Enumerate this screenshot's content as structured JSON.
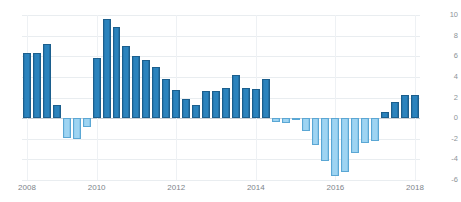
{
  "chart_data": {
    "type": "bar",
    "title": "",
    "subtitle": "",
    "xlabel": "",
    "ylabel": "",
    "ylim": [
      -6,
      10
    ],
    "grid": true,
    "legend": null,
    "y_ticks": [
      10,
      8,
      6,
      4,
      2,
      0,
      -2,
      -4,
      -6
    ],
    "y_tick_labels": [
      "10",
      "8",
      "6",
      "4",
      "2",
      "0",
      "-2",
      "-4",
      "-6"
    ],
    "x_ticks": [
      2008,
      2010,
      2012,
      2014,
      2016,
      2018
    ],
    "x_tick_labels": [
      "2008",
      "2010",
      "2012",
      "2014",
      "2016",
      "2018"
    ],
    "categories": [
      "2008 Q1",
      "2008 Q2",
      "2008 Q3",
      "2008 Q4",
      "2009 Q1",
      "2009 Q2",
      "2009 Q3",
      "2010 Q1",
      "2010 Q2",
      "2010 Q3",
      "2010 Q4",
      "2011 Q1",
      "2011 Q2",
      "2011 Q3",
      "2011 Q4",
      "2012 Q1",
      "2012 Q2",
      "2012 Q3",
      "2012 Q4",
      "2013 Q1",
      "2013 Q2",
      "2013 Q3",
      "2013 Q4",
      "2014 Q1",
      "2014 Q2",
      "2014 Q3",
      "2014 Q4",
      "2015 Q1",
      "2015 Q2",
      "2015 Q3",
      "2015 Q4",
      "2016 Q1",
      "2016 Q2",
      "2016 Q3",
      "2016 Q4",
      "2017 Q1",
      "2017 Q2",
      "2017 Q3",
      "2017 Q4",
      "2018 Q1"
    ],
    "values": [
      6.3,
      6.3,
      7.2,
      1.3,
      -1.9,
      -2.0,
      -0.9,
      5.8,
      9.6,
      8.8,
      7.0,
      6.0,
      5.6,
      5.0,
      3.8,
      2.7,
      1.9,
      1.3,
      2.6,
      2.6,
      2.9,
      4.2,
      2.9,
      2.8,
      3.8,
      -0.4,
      -0.5,
      -0.1,
      -1.2,
      -2.6,
      -4.2,
      -5.6,
      -5.2,
      -3.4,
      -2.4,
      -2.2,
      0.6,
      1.6,
      2.2,
      2.2
    ],
    "colors": {
      "positive_fill": "#2b83bd",
      "positive_border": "#1c5f8d",
      "negative_fill": "#9ed4f2",
      "negative_border": "#5ba7d4",
      "gridline": "#e9edf0",
      "zeroline": "#c8cfd6",
      "axis_text": "#8c9398",
      "background": "#ffffff"
    }
  }
}
